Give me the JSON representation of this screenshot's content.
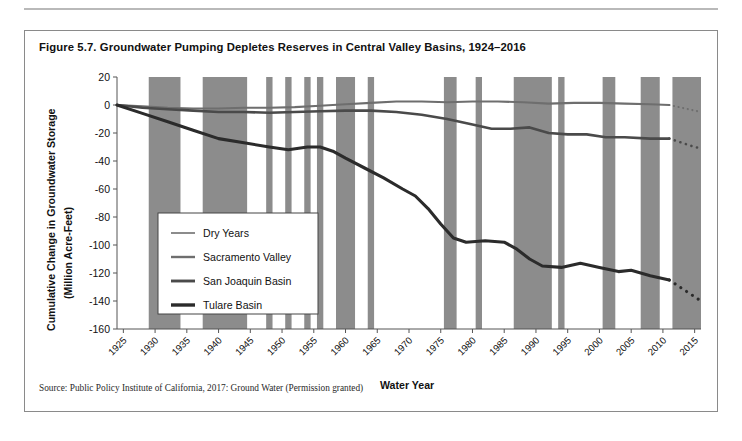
{
  "figure": {
    "title": "Figure 5.7. Groundwater Pumping Depletes Reserves in Central Valley Basins, 1924–2016",
    "source": "Source: Public Policy Institute of California, 2017: Ground Water (Permission granted)"
  },
  "chart_data": {
    "type": "line",
    "title": "Figure 5.7. Groundwater Pumping Depletes Reserves in Central Valley Basins, 1924–2016",
    "xlabel": "Water Year",
    "ylabel": "Cumulative Change in Groundwater Storage (Million Acre-Feet)",
    "ylabel_line1": "Cumulative Change in Groundwater Storage",
    "ylabel_line2": "(Million Acre-Feet)",
    "xlim": [
      1924,
      2016
    ],
    "ylim": [
      -160,
      20
    ],
    "yticks": [
      20,
      0,
      -20,
      -40,
      -60,
      -80,
      -100,
      -120,
      -140,
      -160
    ],
    "xticks": [
      1925,
      1930,
      1935,
      1940,
      1945,
      1950,
      1955,
      1960,
      1965,
      1970,
      1975,
      1980,
      1985,
      1990,
      1995,
      2000,
      2005,
      2010,
      2015
    ],
    "grid": false,
    "legend_position": "center-left",
    "legend": [
      "Dry Years",
      "Sacramento Valley",
      "San Joaquin Basin",
      "Tulare Basin"
    ],
    "colors": {
      "dry_years": "#8c8c8c",
      "sacramento_valley": "#6e6e6e",
      "san_joaquin_basin": "#4a4a4a",
      "tulare_basin": "#2b2b2b",
      "axis": "#555555",
      "plot_background": "#ffffff"
    },
    "dry_year_bands": [
      [
        1929,
        1934
      ],
      [
        1937.5,
        1944.5
      ],
      [
        1947.5,
        1948.5
      ],
      [
        1950.5,
        1951.5
      ],
      [
        1953.5,
        1954.5
      ],
      [
        1955.5,
        1956.5
      ],
      [
        1958.5,
        1961.5
      ],
      [
        1963.5,
        1964.5
      ],
      [
        1975.5,
        1977.5
      ],
      [
        1980.5,
        1981.5
      ],
      [
        1986.5,
        1992.5
      ],
      [
        1993.5,
        1994.5
      ],
      [
        2000.5,
        2002.5
      ],
      [
        2006.5,
        2009.5
      ],
      [
        2011.5,
        2016
      ]
    ],
    "series": [
      {
        "name": "Sacramento Valley",
        "style": "solid",
        "color": "#6e6e6e",
        "points": [
          [
            1924,
            0
          ],
          [
            1928,
            -1
          ],
          [
            1932,
            -2
          ],
          [
            1936,
            -2.5
          ],
          [
            1940,
            -2.5
          ],
          [
            1944,
            -2
          ],
          [
            1948,
            -2
          ],
          [
            1952,
            -1.5
          ],
          [
            1956,
            -0.5
          ],
          [
            1960,
            0.5
          ],
          [
            1964,
            1.5
          ],
          [
            1968,
            2.5
          ],
          [
            1972,
            2.5
          ],
          [
            1976,
            2
          ],
          [
            1980,
            2.5
          ],
          [
            1984,
            2.5
          ],
          [
            1988,
            2
          ],
          [
            1992,
            1
          ],
          [
            1996,
            1.5
          ],
          [
            2000,
            1.5
          ],
          [
            2004,
            1
          ],
          [
            2008,
            0.5
          ],
          [
            2011,
            0
          ]
        ],
        "projection": {
          "style": "dotted",
          "points": [
            [
              2011,
              0
            ],
            [
              2012,
              -1
            ],
            [
              2013,
              -2
            ],
            [
              2014,
              -3
            ],
            [
              2015,
              -4
            ],
            [
              2016,
              -5
            ]
          ]
        },
        "end_value_solid": 0,
        "end_value_projected": -5
      },
      {
        "name": "San Joaquin Basin",
        "style": "solid",
        "color": "#4a4a4a",
        "points": [
          [
            1924,
            0
          ],
          [
            1928,
            -2
          ],
          [
            1932,
            -3
          ],
          [
            1936,
            -4
          ],
          [
            1940,
            -5
          ],
          [
            1944,
            -5
          ],
          [
            1948,
            -5.5
          ],
          [
            1952,
            -5
          ],
          [
            1956,
            -4.5
          ],
          [
            1960,
            -4
          ],
          [
            1964,
            -4
          ],
          [
            1968,
            -5
          ],
          [
            1972,
            -7
          ],
          [
            1976,
            -10
          ],
          [
            1980,
            -14
          ],
          [
            1983,
            -17
          ],
          [
            1986,
            -17
          ],
          [
            1989,
            -16
          ],
          [
            1992,
            -20
          ],
          [
            1995,
            -21
          ],
          [
            1998,
            -21
          ],
          [
            2001,
            -23
          ],
          [
            2004,
            -23
          ],
          [
            2008,
            -24
          ],
          [
            2011,
            -24
          ]
        ],
        "projection": {
          "style": "dotted",
          "points": [
            [
              2011,
              -24
            ],
            [
              2012,
              -25.5
            ],
            [
              2013,
              -27
            ],
            [
              2014,
              -28.5
            ],
            [
              2015,
              -30
            ],
            [
              2016,
              -31
            ]
          ]
        },
        "end_value_solid": -24,
        "end_value_projected": -31
      },
      {
        "name": "Tulare Basin",
        "style": "solid",
        "color": "#2b2b2b",
        "points": [
          [
            1924,
            0
          ],
          [
            1928,
            -6
          ],
          [
            1932,
            -12
          ],
          [
            1936,
            -18
          ],
          [
            1940,
            -24
          ],
          [
            1944,
            -27
          ],
          [
            1948,
            -30
          ],
          [
            1951,
            -32
          ],
          [
            1954,
            -30
          ],
          [
            1956,
            -30
          ],
          [
            1958,
            -33
          ],
          [
            1960,
            -38
          ],
          [
            1963,
            -45
          ],
          [
            1966,
            -52
          ],
          [
            1969,
            -60
          ],
          [
            1971,
            -65
          ],
          [
            1973,
            -74
          ],
          [
            1975,
            -85
          ],
          [
            1977,
            -95
          ],
          [
            1979,
            -98
          ],
          [
            1982,
            -97
          ],
          [
            1985,
            -98
          ],
          [
            1987,
            -103
          ],
          [
            1989,
            -110
          ],
          [
            1991,
            -115
          ],
          [
            1994,
            -116
          ],
          [
            1997,
            -113
          ],
          [
            2000,
            -116
          ],
          [
            2003,
            -119
          ],
          [
            2005,
            -118
          ],
          [
            2008,
            -122
          ],
          [
            2011,
            -125
          ]
        ],
        "projection": {
          "style": "dotted",
          "points": [
            [
              2011,
              -125
            ],
            [
              2012,
              -128
            ],
            [
              2013,
              -131
            ],
            [
              2014,
              -134
            ],
            [
              2015,
              -137
            ],
            [
              2016,
              -140
            ]
          ]
        },
        "end_value_solid": -125,
        "end_value_projected": -140
      }
    ]
  }
}
